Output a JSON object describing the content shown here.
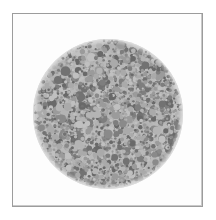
{
  "image": {
    "kind": "ishihara-plate",
    "title": "Ishihara color vision test plate",
    "description": "Grayscale reproduction of a pseudoisochromatic color-vision test plate: a filled circle of densely packed dots of varying size in two gray tones on a white page.",
    "caption": ""
  },
  "page": {
    "background_color": "#ffffff",
    "width": 216,
    "height": 220
  },
  "frame": {
    "name": "plate-border",
    "left": 12,
    "top": 13,
    "width": 191,
    "height": 194,
    "border_color": "#9c9c9c",
    "border_width": 1,
    "fill_color": "#fdfdfd",
    "shadow_color": "#c9c9c9"
  },
  "plate": {
    "center_x": 95,
    "center_y": 100,
    "radius": 75,
    "disc_background_color": "#b9b9b9",
    "dot_colors": [
      "#b4b4b4",
      "#aaaaaa",
      "#c0c0c0",
      "#9b9b9b",
      "#7e7e7e",
      "#727272",
      "#8a8a8a",
      "#696969"
    ],
    "light_tone": "#b4b4b4",
    "dark_tone": "#777777",
    "dot_count": 2400,
    "dot_radius_min": 1.1,
    "dot_radius_max": 5.0,
    "dark_fraction": 0.42,
    "seed": 20240517,
    "hidden_figure_visible": false
  },
  "chart_data": {
    "type": "scatter",
    "xlabel": "",
    "ylabel": "",
    "xlim": [
      0,
      191
    ],
    "ylim": [
      0,
      194
    ],
    "grid": false,
    "legend": null
  }
}
